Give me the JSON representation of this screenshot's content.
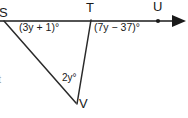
{
  "figure": {
    "background_color": "#ffffff",
    "stroke_color": "#1a1a1a",
    "text_color": "#1a1a1a",
    "width": 188,
    "height": 118,
    "points": [
      {
        "name": "S",
        "label": "S",
        "x": 4,
        "y": 21,
        "label_x": -1,
        "label_y": 6,
        "marker": "none",
        "clipped": true
      },
      {
        "name": "T",
        "label": "T",
        "x": 91,
        "y": 20,
        "label_x": 86,
        "label_y": 2,
        "marker": "none",
        "clipped": false
      },
      {
        "name": "U",
        "label": "U",
        "x": 158,
        "y": 21,
        "label_x": 153,
        "label_y": 1,
        "marker": "dot",
        "clipped": false
      },
      {
        "name": "V",
        "label": "V",
        "x": 76,
        "y": 102,
        "label_x": 79,
        "label_y": 99,
        "marker": "none",
        "clipped": false
      }
    ],
    "segments": [
      {
        "name": "ray-SU",
        "from": "S",
        "to": "arrowhead",
        "x1": 0,
        "y1": 21,
        "x2": 174,
        "y2": 21,
        "arrow": true
      },
      {
        "name": "segment-SV",
        "from": "S",
        "to": "V",
        "x1": 5,
        "y1": 22,
        "x2": 76,
        "y2": 103,
        "arrow": false
      },
      {
        "name": "segment-TV",
        "from": "T",
        "to": "V",
        "x1": 91,
        "y1": 20,
        "x2": 77,
        "y2": 104,
        "arrow": false
      }
    ],
    "angle_labels": [
      {
        "name": "angle-at-S",
        "text": "(3y + 1)°",
        "x": 19,
        "y": 22,
        "size": "normal"
      },
      {
        "name": "angle-at-T",
        "text": "(7y − 37)°",
        "x": 94,
        "y": 22,
        "size": "normal"
      },
      {
        "name": "angle-at-V",
        "text": "2y°",
        "x": 62,
        "y": 74,
        "size": "small"
      }
    ],
    "edge_fragment": {
      "name": "clipped-left-glyph",
      "text": "t",
      "x": -2,
      "y": 73
    },
    "arrowhead": {
      "name": "ray-arrowhead",
      "tip_x": 186,
      "tip_y": 21,
      "back_x": 172,
      "half_height": 6
    }
  }
}
